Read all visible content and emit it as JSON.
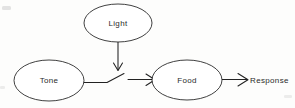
{
  "diagram": {
    "background_color": "#fdfdfc",
    "stroke_color": "#1f1f1f",
    "text_color": "#2b2b2b",
    "nodes": [
      {
        "id": "light",
        "label": "Light",
        "shape": "ellipse",
        "cx": 118,
        "cy": 23,
        "rx": 34,
        "ry": 19
      },
      {
        "id": "tone",
        "label": "Tone",
        "shape": "ellipse",
        "cx": 49,
        "cy": 80.5,
        "rx": 35,
        "ry": 20.5
      },
      {
        "id": "food",
        "label": "Food",
        "shape": "ellipse",
        "cx": 187,
        "cy": 80,
        "rx": 35,
        "ry": 20
      }
    ],
    "outcome": {
      "id": "response",
      "label": "Response",
      "x": 250,
      "y": 80
    },
    "edges": [
      {
        "id": "light-to-junction",
        "from": "light",
        "to": "tone-food-link",
        "type": "arrow",
        "direction": "down",
        "arrowhead": "open-chevron"
      },
      {
        "id": "tone-to-junction",
        "from": "tone",
        "to": "junction",
        "type": "line",
        "direction": "right-up",
        "arrowhead": "none"
      },
      {
        "id": "junction-to-food",
        "from": "junction",
        "to": "food",
        "type": "arrow",
        "direction": "right",
        "arrowhead": "open-chevron"
      },
      {
        "id": "food-to-response",
        "from": "food",
        "to": "response",
        "type": "arrow",
        "direction": "right",
        "arrowhead": "open-chevron"
      }
    ]
  }
}
